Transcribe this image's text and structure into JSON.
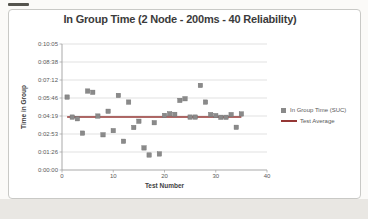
{
  "chart": {
    "title": "In Group Time (2 Node - 200ms - 40 Reliability)",
    "x_axis": {
      "title": "Test Number",
      "ticks": [
        "0",
        "10",
        "20",
        "30",
        "40"
      ]
    },
    "y_axis": {
      "title": "Time in Group",
      "ticks": [
        "0:00:00",
        "0:01:26",
        "0:02:53",
        "0:04:19",
        "0:05:46",
        "0:07:12",
        "0:08:38",
        "0:10:05"
      ]
    },
    "legend": [
      {
        "label": "In Group Time (SUC)",
        "swatch": "square-marker",
        "color": "#8a8a8a"
      },
      {
        "label": "Test Average",
        "swatch": "line",
        "color": "#953735"
      }
    ]
  },
  "chart_data": {
    "type": "scatter",
    "title": "In Group Time (2 Node - 200ms - 40 Reliability)",
    "xlabel": "Test Number",
    "ylabel": "Time in Group",
    "xlim": [
      0,
      40
    ],
    "x_tick_interval": 10,
    "ylim": [
      "0:00:00",
      "0:10:05"
    ],
    "ylim_seconds": [
      0,
      604.8
    ],
    "y_tick_interval_seconds": 86.4,
    "y_tick_labels": [
      "0:00:00",
      "0:01:26",
      "0:02:53",
      "0:04:19",
      "0:05:46",
      "0:07:12",
      "0:08:38",
      "0:10:05"
    ],
    "grid": true,
    "legend_position": "right",
    "series": [
      {
        "name": "In Group Time (SUC)",
        "type": "scatter",
        "marker": "square",
        "color": "#8a8a8a",
        "x": [
          1,
          2,
          3,
          4,
          5,
          6,
          7,
          8,
          9,
          10,
          11,
          12,
          13,
          14,
          15,
          16,
          17,
          18,
          19,
          20,
          21,
          22,
          23,
          24,
          25,
          26,
          27,
          28,
          29,
          30,
          31,
          32,
          33,
          34,
          35
        ],
        "y": [
          "0:05:50",
          "0:04:14",
          "0:04:06",
          "0:02:57",
          "0:06:19",
          "0:06:13",
          "0:04:19",
          "0:02:49",
          "0:04:42",
          "0:03:09",
          "0:05:58",
          "0:02:18",
          "0:05:26",
          "0:03:24",
          "0:03:54",
          "0:01:46",
          "0:01:12",
          "0:03:47",
          "0:01:17",
          "0:04:22",
          "0:04:30",
          "0:04:27",
          "0:05:34",
          "0:05:42",
          "0:04:14",
          "0:04:14",
          "0:06:46",
          "0:05:26",
          "0:04:26",
          "0:04:21",
          "0:04:13",
          "0:04:13",
          "0:04:26",
          "0:03:25",
          "0:04:29"
        ],
        "y_seconds": [
          350,
          254,
          246,
          177,
          379,
          373,
          259,
          169,
          282,
          189,
          358,
          138,
          326,
          204,
          234,
          106,
          72,
          227,
          77,
          262,
          270,
          267,
          334,
          342,
          254,
          254,
          406,
          326,
          266,
          261,
          253,
          253,
          266,
          205,
          269
        ]
      },
      {
        "name": "Test Average",
        "type": "line",
        "color": "#953735",
        "x": [
          1,
          35
        ],
        "value": "0:04:15",
        "value_seconds": 254.5
      }
    ]
  }
}
